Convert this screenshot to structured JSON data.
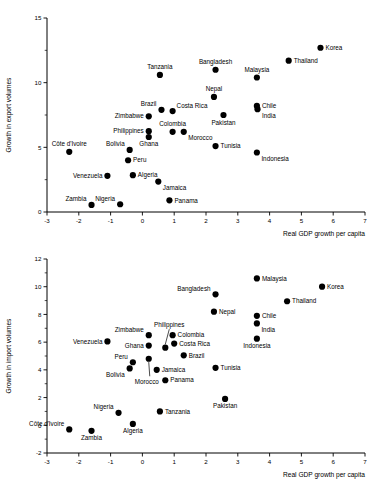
{
  "chart_data": [
    {
      "id": "exports",
      "type": "scatter",
      "title": "",
      "xlabel": "Real GDP growth per capita",
      "ylabel": "Growth in export volumes",
      "xlim": [
        -3,
        7
      ],
      "ylim": [
        0,
        15
      ],
      "xticks": [
        -3,
        -2,
        -1,
        0,
        1,
        2,
        3,
        4,
        5,
        6,
        7
      ],
      "yticks": [
        0,
        5,
        10,
        15
      ],
      "yminor": [
        2.5,
        7.5,
        12.5
      ],
      "grid": false,
      "legend": null,
      "points": [
        {
          "label": "Korea",
          "x": 5.6,
          "y": 12.7,
          "lp": "right"
        },
        {
          "label": "Thailand",
          "x": 4.6,
          "y": 11.7,
          "lp": "right"
        },
        {
          "label": "Bangladesh",
          "x": 2.3,
          "y": 11.0,
          "lp": "above"
        },
        {
          "label": "Tanzania",
          "x": 0.55,
          "y": 10.6,
          "lp": "above"
        },
        {
          "label": "Malaysia",
          "x": 3.6,
          "y": 10.4,
          "lp": "above"
        },
        {
          "label": "Nepal",
          "x": 2.25,
          "y": 8.9,
          "lp": "above"
        },
        {
          "label": "Chile",
          "x": 3.6,
          "y": 8.2,
          "lp": "right"
        },
        {
          "label": "India",
          "x": 3.62,
          "y": 7.95,
          "lp": "below-right"
        },
        {
          "label": "Costa Rica",
          "x": 0.95,
          "y": 7.8,
          "lp": "above-right"
        },
        {
          "label": "Brazil",
          "x": 0.6,
          "y": 7.9,
          "lp": "above-left"
        },
        {
          "label": "Pakistan",
          "x": 2.55,
          "y": 7.5,
          "lp": "below"
        },
        {
          "label": "Zimbabwe",
          "x": 0.2,
          "y": 7.4,
          "lp": "left"
        },
        {
          "label": "Colombia",
          "x": 0.95,
          "y": 6.2,
          "lp": "above"
        },
        {
          "label": "Morocco",
          "x": 1.3,
          "y": 6.2,
          "lp": "below-right"
        },
        {
          "label": "Philippines",
          "x": 0.2,
          "y": 6.25,
          "lp": "left"
        },
        {
          "label": "Ghana",
          "x": 0.2,
          "y": 5.8,
          "lp": "below"
        },
        {
          "label": "Tunisia",
          "x": 2.3,
          "y": 5.1,
          "lp": "right"
        },
        {
          "label": "Bolivia",
          "x": -0.4,
          "y": 4.8,
          "lp": "above-left"
        },
        {
          "label": "Côte d'Ivoire",
          "x": -2.3,
          "y": 4.65,
          "lp": "above"
        },
        {
          "label": "Indonesia",
          "x": 3.6,
          "y": 4.6,
          "lp": "below-right"
        },
        {
          "label": "Peru",
          "x": -0.45,
          "y": 4.0,
          "lp": "right"
        },
        {
          "label": "Algeria",
          "x": -0.3,
          "y": 2.85,
          "lp": "right"
        },
        {
          "label": "Venezuela",
          "x": -1.1,
          "y": 2.8,
          "lp": "left"
        },
        {
          "label": "Jamaica",
          "x": 0.5,
          "y": 2.35,
          "lp": "below-right"
        },
        {
          "label": "Panama",
          "x": 0.85,
          "y": 0.9,
          "lp": "right"
        },
        {
          "label": "Zambia",
          "x": -1.6,
          "y": 0.55,
          "lp": "above-left"
        },
        {
          "label": "Nigeria",
          "x": -0.7,
          "y": 0.6,
          "lp": "above-left"
        }
      ]
    },
    {
      "id": "imports",
      "type": "scatter",
      "title": "",
      "xlabel": "Real GDP growth per capita",
      "ylabel": "Growth in import volumes",
      "xlim": [
        -3,
        7
      ],
      "ylim": [
        -2,
        12
      ],
      "xticks": [
        -3,
        -2,
        -1,
        0,
        1,
        2,
        3,
        4,
        5,
        6,
        7
      ],
      "yticks": [
        -2,
        0,
        2,
        4,
        6,
        8,
        10,
        12
      ],
      "yminor": [
        -1,
        1,
        3,
        5,
        7,
        9,
        11
      ],
      "grid": false,
      "legend": null,
      "points": [
        {
          "label": "Malaysia",
          "x": 3.6,
          "y": 10.6,
          "lp": "right"
        },
        {
          "label": "Korea",
          "x": 5.65,
          "y": 10.0,
          "lp": "right"
        },
        {
          "label": "Bangladesh",
          "x": 2.3,
          "y": 9.45,
          "lp": "above-left"
        },
        {
          "label": "Thailand",
          "x": 4.55,
          "y": 8.95,
          "lp": "right"
        },
        {
          "label": "Nepal",
          "x": 2.25,
          "y": 8.2,
          "lp": "right"
        },
        {
          "label": "Chile",
          "x": 3.6,
          "y": 7.9,
          "lp": "right"
        },
        {
          "label": "India",
          "x": 3.6,
          "y": 7.35,
          "lp": "below-right"
        },
        {
          "label": "Zimbabwe",
          "x": 0.2,
          "y": 6.5,
          "lp": "above-left"
        },
        {
          "label": "Colombia",
          "x": 0.95,
          "y": 6.5,
          "lp": "right"
        },
        {
          "label": "Indonesia",
          "x": 3.6,
          "y": 6.25,
          "lp": "below"
        },
        {
          "label": "Venezuela",
          "x": -1.1,
          "y": 6.05,
          "lp": "left"
        },
        {
          "label": "Costa Rica",
          "x": 1.0,
          "y": 5.9,
          "lp": "right"
        },
        {
          "label": "Ghana",
          "x": 0.2,
          "y": 5.75,
          "lp": "left"
        },
        {
          "label": "Philippines",
          "x": 0.72,
          "y": 5.6,
          "lp": "leader-up"
        },
        {
          "label": "Brazil",
          "x": 1.3,
          "y": 5.05,
          "lp": "right"
        },
        {
          "label": "Morocco",
          "x": 0.2,
          "y": 4.8,
          "lp": "leader-down"
        },
        {
          "label": "Peru",
          "x": -0.3,
          "y": 4.55,
          "lp": "above-left"
        },
        {
          "label": "Tunisia",
          "x": 2.3,
          "y": 4.15,
          "lp": "right"
        },
        {
          "label": "Bolivia",
          "x": -0.4,
          "y": 4.1,
          "lp": "below-left"
        },
        {
          "label": "Jamaica",
          "x": 0.45,
          "y": 4.0,
          "lp": "right"
        },
        {
          "label": "Panama",
          "x": 0.72,
          "y": 3.25,
          "lp": "right"
        },
        {
          "label": "Pakistan",
          "x": 2.6,
          "y": 1.9,
          "lp": "below"
        },
        {
          "label": "Tanzania",
          "x": 0.55,
          "y": 1.0,
          "lp": "right"
        },
        {
          "label": "Nigeria",
          "x": -0.75,
          "y": 0.9,
          "lp": "above-left"
        },
        {
          "label": "Algeria",
          "x": -0.3,
          "y": 0.1,
          "lp": "below"
        },
        {
          "label": "Côte d'Ivoire",
          "x": -2.3,
          "y": -0.3,
          "lp": "above-left"
        },
        {
          "label": "Zambia",
          "x": -1.6,
          "y": -0.4,
          "lp": "below"
        }
      ]
    }
  ]
}
